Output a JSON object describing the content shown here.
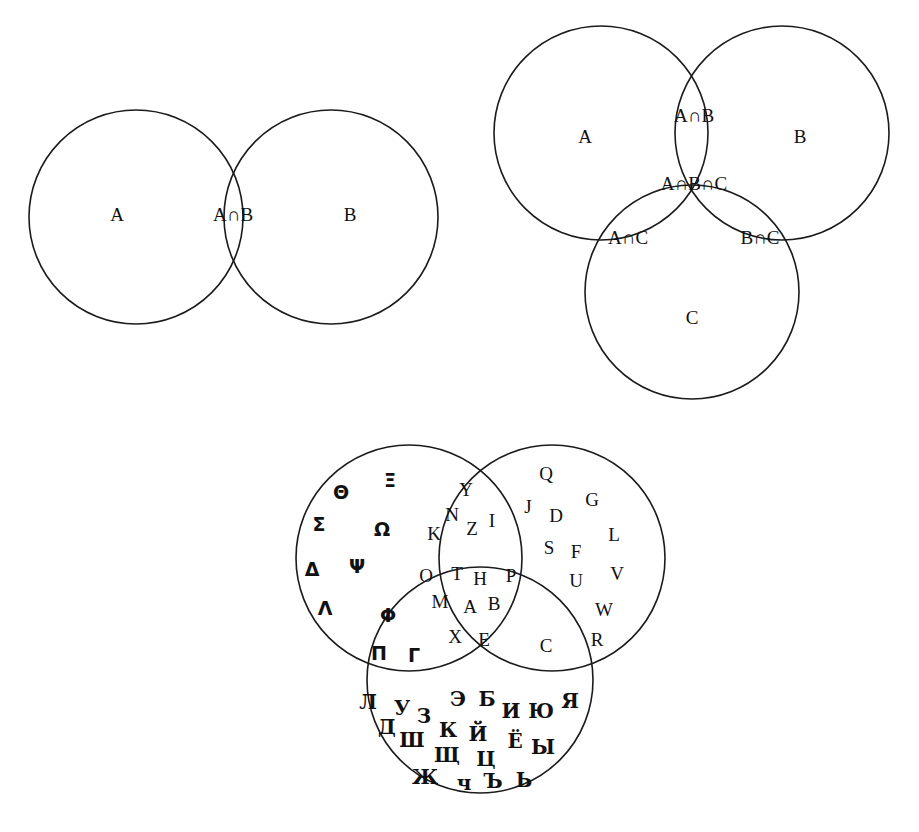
{
  "page": {
    "background_color": "#ffffff",
    "stroke_color": "#1b1b1b",
    "text_color": "#111111",
    "width": 919,
    "height": 832
  },
  "diagram_two_set": {
    "name": "two-set-venn",
    "circles": [
      {
        "id": "A",
        "cx": 136,
        "cy": 217,
        "r": 107
      },
      {
        "id": "B",
        "cx": 331,
        "cy": 217,
        "r": 107
      }
    ],
    "labels": {
      "a": "A",
      "intersection_ab": "A∩B",
      "b": "B"
    },
    "label_positions": {
      "a": {
        "x": 117,
        "y": 217
      },
      "intersection_ab": {
        "x": 233,
        "y": 217
      },
      "b": {
        "x": 350,
        "y": 217
      }
    }
  },
  "diagram_three_set": {
    "name": "three-set-venn",
    "circles": [
      {
        "id": "A",
        "cx": 601,
        "cy": 133,
        "r": 107
      },
      {
        "id": "B",
        "cx": 782,
        "cy": 133,
        "r": 107
      },
      {
        "id": "C",
        "cx": 692,
        "cy": 292,
        "r": 107
      }
    ],
    "labels": {
      "a": "A",
      "b": "B",
      "c": "C",
      "intersection_ab": "A∩B",
      "intersection_ac": "A∩C",
      "intersection_bc": "B∩C",
      "intersection_abc": "A∩B∩C"
    },
    "label_positions": {
      "a": {
        "x": 585,
        "y": 139
      },
      "b": {
        "x": 800,
        "y": 139
      },
      "c": {
        "x": 692,
        "y": 320
      },
      "intersection_ab": {
        "x": 694,
        "y": 118
      },
      "intersection_ac": {
        "x": 628,
        "y": 240
      },
      "intersection_bc": {
        "x": 760,
        "y": 240
      },
      "intersection_abc": {
        "x": 694,
        "y": 186
      }
    }
  },
  "diagram_alphabets": {
    "name": "alphabet-venn",
    "circles": [
      {
        "id": "greek",
        "cx": 409,
        "cy": 558,
        "r": 113
      },
      {
        "id": "latin",
        "cx": 552,
        "cy": 558,
        "r": 113
      },
      {
        "id": "cyrillic",
        "cx": 480,
        "cy": 680,
        "r": 113
      }
    ],
    "regions": {
      "greek_only": {
        "label": "Greek only",
        "letters": [
          {
            "ch": "Θ",
            "x": 341,
            "y": 493
          },
          {
            "ch": "Ξ",
            "x": 390,
            "y": 481
          },
          {
            "ch": "Σ",
            "x": 319,
            "y": 525
          },
          {
            "ch": "Ω",
            "x": 382,
            "y": 530
          },
          {
            "ch": "Δ",
            "x": 312,
            "y": 570
          },
          {
            "ch": "Ψ",
            "x": 357,
            "y": 567
          },
          {
            "ch": "Λ",
            "x": 325,
            "y": 609
          }
        ]
      },
      "greek_latin": {
        "label": "Greek ∩ Latin",
        "letters": [
          {
            "ch": "Y",
            "x": 466,
            "y": 492
          },
          {
            "ch": "N",
            "x": 452,
            "y": 517
          },
          {
            "ch": "Z",
            "x": 472,
            "y": 531
          },
          {
            "ch": "I",
            "x": 492,
            "y": 523
          },
          {
            "ch": "K",
            "x": 434,
            "y": 536
          }
        ]
      },
      "latin_only": {
        "label": "Latin only",
        "letters": [
          {
            "ch": "Q",
            "x": 546,
            "y": 476
          },
          {
            "ch": "J",
            "x": 528,
            "y": 509
          },
          {
            "ch": "D",
            "x": 556,
            "y": 518
          },
          {
            "ch": "G",
            "x": 592,
            "y": 502
          },
          {
            "ch": "S",
            "x": 549,
            "y": 550
          },
          {
            "ch": "F",
            "x": 576,
            "y": 554
          },
          {
            "ch": "L",
            "x": 614,
            "y": 537
          },
          {
            "ch": "U",
            "x": 576,
            "y": 583
          },
          {
            "ch": "V",
            "x": 617,
            "y": 576
          },
          {
            "ch": "W",
            "x": 604,
            "y": 612
          },
          {
            "ch": "R",
            "x": 597,
            "y": 642
          }
        ]
      },
      "all_three": {
        "label": "Greek ∩ Latin ∩ Cyrillic",
        "letters": [
          {
            "ch": "O",
            "x": 426,
            "y": 578
          },
          {
            "ch": "T",
            "x": 457,
            "y": 576
          },
          {
            "ch": "H",
            "x": 480,
            "y": 581
          },
          {
            "ch": "P",
            "x": 511,
            "y": 578
          },
          {
            "ch": "M",
            "x": 440,
            "y": 604
          },
          {
            "ch": "A",
            "x": 470,
            "y": 609
          },
          {
            "ch": "B",
            "x": 494,
            "y": 606
          },
          {
            "ch": "X",
            "x": 455,
            "y": 639
          },
          {
            "ch": "E",
            "x": 484,
            "y": 642
          }
        ]
      },
      "greek_cyrillic": {
        "label": "Greek ∩ Cyrillic",
        "letters": [
          {
            "ch": "Φ",
            "x": 388,
            "y": 616
          },
          {
            "ch": "Π",
            "x": 379,
            "y": 654
          },
          {
            "ch": "Γ",
            "x": 414,
            "y": 656
          }
        ]
      },
      "latin_cyrillic": {
        "label": "Latin ∩ Cyrillic",
        "letters": [
          {
            "ch": "C",
            "x": 546,
            "y": 648
          }
        ]
      },
      "cyrillic_only": {
        "label": "Cyrillic only",
        "letters": [
          {
            "ch": "Л",
            "x": 368,
            "y": 703
          },
          {
            "ch": "У",
            "x": 402,
            "y": 709
          },
          {
            "ch": "З",
            "x": 424,
            "y": 717
          },
          {
            "ch": "Э",
            "x": 458,
            "y": 700
          },
          {
            "ch": "Б",
            "x": 487,
            "y": 700
          },
          {
            "ch": "И",
            "x": 511,
            "y": 712
          },
          {
            "ch": "Ю",
            "x": 541,
            "y": 712
          },
          {
            "ch": "Я",
            "x": 570,
            "y": 702
          },
          {
            "ch": "Д",
            "x": 387,
            "y": 728
          },
          {
            "ch": "Ш",
            "x": 412,
            "y": 741
          },
          {
            "ch": "К",
            "x": 448,
            "y": 731
          },
          {
            "ch": "Й",
            "x": 478,
            "y": 735
          },
          {
            "ch": "Ё",
            "x": 515,
            "y": 742
          },
          {
            "ch": "Ы",
            "x": 543,
            "y": 748
          },
          {
            "ch": "Щ",
            "x": 447,
            "y": 756
          },
          {
            "ch": "Ц",
            "x": 486,
            "y": 760
          },
          {
            "ch": "Ж",
            "x": 425,
            "y": 778
          },
          {
            "ch": "ч",
            "x": 464,
            "y": 784
          },
          {
            "ch": "Ъ",
            "x": 493,
            "y": 782
          },
          {
            "ch": "Ь",
            "x": 524,
            "y": 781
          }
        ]
      }
    }
  }
}
